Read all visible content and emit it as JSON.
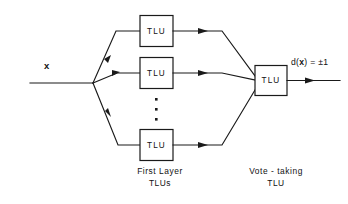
{
  "diagram": {
    "background_color": "#ffffff",
    "line_color": "#1a1a1a",
    "input": {
      "label": "x",
      "name": "input-signal-x"
    },
    "output": {
      "label": "d(x) = ±1",
      "label_prefix": "d(",
      "label_variable": "x",
      "label_suffix": ") = ±1",
      "name": "output-decision"
    },
    "first_layer": {
      "caption_line1": "First Layer",
      "caption_line2": "TLUs",
      "units": [
        {
          "label": "TLU",
          "name": "first-layer-tlu-1"
        },
        {
          "label": "TLU",
          "name": "first-layer-tlu-2"
        },
        {
          "label": "TLU",
          "name": "first-layer-tlu-n"
        }
      ],
      "ellipsis_dots": 3
    },
    "vote_layer": {
      "caption_line1": "Vote - taking",
      "caption_line2": "TLU",
      "unit": {
        "label": "TLU",
        "name": "vote-taking-tlu"
      }
    }
  }
}
